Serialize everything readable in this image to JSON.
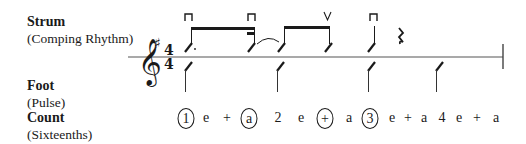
{
  "labels": {
    "strum": {
      "title": "Strum",
      "subtitle": "(Comping Rhythm)"
    },
    "foot": {
      "title": "Foot",
      "subtitle": "(Pulse)"
    },
    "count": {
      "title": "Count",
      "subtitle": "(Sixteenths)"
    }
  },
  "notation": {
    "clef": "treble-clef",
    "key_signature": "♯",
    "time_signature": {
      "top": "4",
      "bottom": "4"
    },
    "strum_marks": [
      "down-bow",
      "down-bow",
      "up-bow",
      "down-bow"
    ],
    "rest": "quarter-rest"
  },
  "count": [
    {
      "text": "1",
      "circled": true
    },
    {
      "text": "e",
      "circled": false
    },
    {
      "text": "+",
      "circled": false
    },
    {
      "text": "a",
      "circled": true
    },
    {
      "text": "2",
      "circled": false
    },
    {
      "text": "e",
      "circled": false
    },
    {
      "text": "+",
      "circled": true
    },
    {
      "text": "a",
      "circled": false
    },
    {
      "text": "3",
      "circled": true
    },
    {
      "text": "e",
      "circled": false
    },
    {
      "text": "+",
      "circled": false
    },
    {
      "text": "a",
      "circled": false
    },
    {
      "text": "4",
      "circled": false
    },
    {
      "text": "e",
      "circled": false
    },
    {
      "text": "+",
      "circled": false
    },
    {
      "text": "a",
      "circled": false
    }
  ]
}
